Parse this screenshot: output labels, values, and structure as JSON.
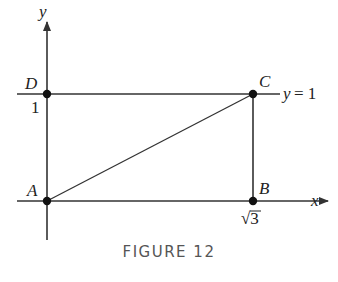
{
  "figure": {
    "caption": "FIGURE 12",
    "axes": {
      "x_label": "x",
      "y_label": "y"
    },
    "points": [
      {
        "name": "A",
        "coords": [
          0,
          0
        ]
      },
      {
        "name": "B",
        "coords": [
          "√3",
          0
        ]
      },
      {
        "name": "C",
        "coords": [
          "√3",
          1
        ]
      },
      {
        "name": "D",
        "coords": [
          0,
          1
        ]
      }
    ],
    "tick_labels": {
      "y_tick": "1",
      "x_tick": "√3",
      "x_tick_radicand": "3",
      "x_tick_radical": "√"
    },
    "line_label": {
      "y_eq": "y",
      "eq": "= 1"
    },
    "colors": {
      "line": "#333333",
      "text": "#222222",
      "caption": "#555555"
    }
  }
}
